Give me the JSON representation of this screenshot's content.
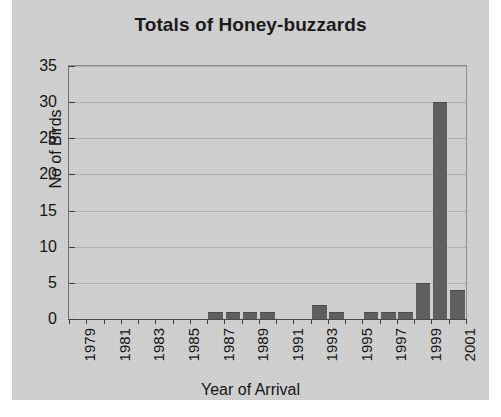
{
  "chart_data": {
    "type": "bar",
    "title": "Totals of Honey-buzzards",
    "xlabel": "Year of Arrival",
    "ylabel": "No of Birds",
    "categories": [
      "1979",
      "1980",
      "1981",
      "1982",
      "1983",
      "1984",
      "1985",
      "1986",
      "1987",
      "1988",
      "1989",
      "1990",
      "1991",
      "1992",
      "1993",
      "1994",
      "1995",
      "1996",
      "1997",
      "1998",
      "1999",
      "2000",
      "2001"
    ],
    "values": [
      0,
      0,
      0,
      0,
      0,
      0,
      0,
      0,
      1,
      1,
      1,
      1,
      0,
      0,
      2,
      1,
      0,
      1,
      1,
      1,
      5,
      30,
      4
    ],
    "xtick_labels": [
      "1979",
      "1981",
      "1983",
      "1985",
      "1987",
      "1989",
      "1991",
      "1993",
      "1995",
      "1997",
      "1999",
      "2001"
    ],
    "yticks": [
      0,
      5,
      10,
      15,
      20,
      25,
      30,
      35
    ],
    "ylim": [
      0,
      35
    ],
    "grid": true,
    "legend": "none",
    "bar_color": "#5f5f5f",
    "plot_background": "#d2d2d2",
    "gridline_color": "#b0b0b0",
    "axis_color": "#3d3d3d",
    "text_color": "#151515"
  }
}
